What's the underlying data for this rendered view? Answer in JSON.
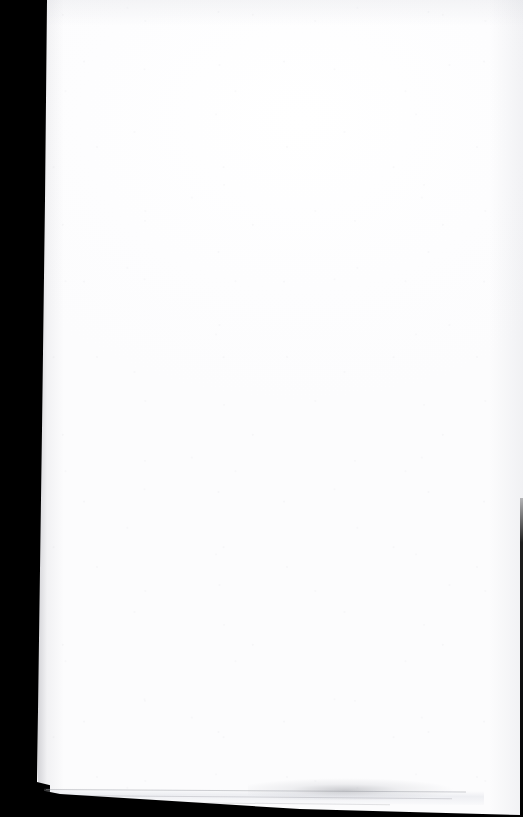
{
  "page": {
    "kind": "scanned-document-page",
    "content_text": "",
    "is_blank": true,
    "width": 523,
    "height": 817,
    "orientation": "portrait"
  },
  "colors": {
    "paper": "#ffffff",
    "paper_shade": "#fcfcfd",
    "gutter_black": "#000000",
    "edge_line": "#969aa0",
    "smudge": "#84868c"
  },
  "regions": {
    "gutter_band": {
      "label": "scanner gutter shadow",
      "side": "left",
      "width_px": 50
    },
    "paper_area": {
      "label": "blank paper surface",
      "left_px": 46,
      "top_px": 0,
      "width_px": 477,
      "height_px": 788
    },
    "bottom_edge": {
      "label": "page edge stack lines",
      "top_px": 788
    },
    "bottom_wedge": {
      "label": "dark area below page edge",
      "top_px": 782
    },
    "right_edge": {
      "label": "dark right edge line",
      "top_px": 498
    }
  },
  "marks": {
    "page_edge_lines": 3,
    "bottom_smudge_label": "faint grey smudge",
    "speckle_label": "paper grain speckle"
  }
}
